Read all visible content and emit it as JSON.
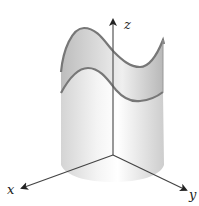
{
  "figure": {
    "axes": {
      "x": {
        "label": "x"
      },
      "y": {
        "label": "y"
      },
      "z": {
        "label": "z"
      }
    },
    "colors": {
      "axis": "#333333",
      "curve": "#777777",
      "surface_fill": "#cfcfcf",
      "cylinder_fill": "#e6e6e6"
    }
  }
}
